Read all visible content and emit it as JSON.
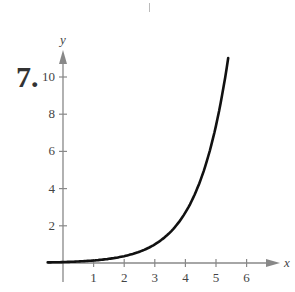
{
  "problem_number": "7.",
  "chart_data": {
    "type": "line",
    "title": "",
    "xlabel": "x",
    "ylabel": "y",
    "xlim": [
      -0.5,
      6.8
    ],
    "ylim": [
      0,
      11.5
    ],
    "grid": false,
    "legend": null,
    "x_ticks": [
      1,
      2,
      3,
      4,
      5,
      6
    ],
    "y_ticks": [
      2,
      4,
      6,
      8,
      10
    ],
    "x_tick_labels": [
      "1",
      "2",
      "3",
      "4",
      "5",
      "6"
    ],
    "y_tick_labels": [
      "2",
      "4",
      "6",
      "8",
      "10"
    ],
    "series": [
      {
        "name": "curve",
        "description": "exponential growth curve, approx y = e^(x-3)",
        "x": [
          -0.5,
          0,
          1,
          2,
          3,
          3.5,
          4,
          4.5,
          5,
          5.4
        ],
        "values": [
          0.03,
          0.05,
          0.14,
          0.37,
          1.0,
          1.65,
          2.72,
          4.48,
          7.39,
          11.0
        ]
      }
    ]
  },
  "colors": {
    "axis": "#888888",
    "curve": "#111111",
    "text": "#444444"
  }
}
